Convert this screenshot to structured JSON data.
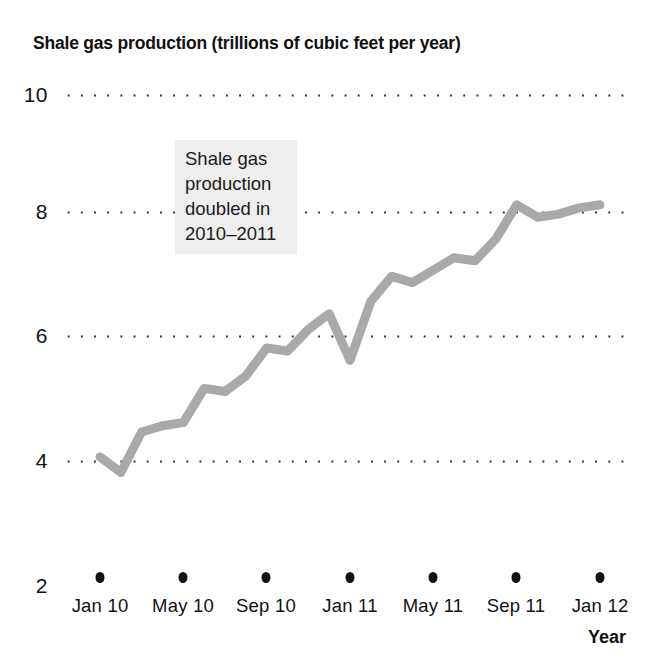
{
  "chart_data": {
    "type": "line",
    "title": "Shale gas production (trillions of cubic feet per year)",
    "xlabel": "Year",
    "ylabel": "",
    "ylim": [
      2,
      10
    ],
    "y_ticks": [
      "10",
      "8",
      "6",
      "4",
      "2"
    ],
    "y_tick_values": [
      10,
      8,
      6,
      4,
      2
    ],
    "gridlines_at": [
      10,
      8,
      6,
      4
    ],
    "grid": "dotted-horizontal",
    "legend": "none",
    "x_ticks": [
      "Jan 10",
      "May 10",
      "Sep 10",
      "Jan 11",
      "May 11",
      "Sep 11",
      "Jan 12"
    ],
    "x_tick_values": [
      0,
      4,
      8,
      12,
      16,
      20,
      24
    ],
    "x": [
      "Jan 10",
      "Feb 10",
      "Mar 10",
      "Apr 10",
      "May 10",
      "Jun 10",
      "Jul 10",
      "Aug 10",
      "Sep 10",
      "Oct 10",
      "Nov 10",
      "Dec 10",
      "Jan 11",
      "Feb 11",
      "Mar 11",
      "Apr 11",
      "May 11",
      "Jun 11",
      "Jul 11",
      "Aug 11",
      "Sep 11",
      "Oct 11",
      "Nov 11",
      "Dec 11",
      "Jan 12"
    ],
    "values": [
      4.05,
      3.8,
      4.45,
      4.55,
      4.6,
      5.15,
      5.1,
      5.35,
      5.8,
      5.75,
      6.1,
      6.35,
      5.6,
      6.55,
      6.95,
      6.85,
      7.05,
      7.25,
      7.2,
      7.55,
      8.1,
      7.9,
      7.95,
      8.05,
      8.1
    ],
    "series_color": "#a9a9a9",
    "line_width": 9,
    "annotation": {
      "lines": [
        "Shale gas",
        "production",
        "doubled in",
        "2010–2011"
      ],
      "background": "#eeeeee"
    }
  }
}
